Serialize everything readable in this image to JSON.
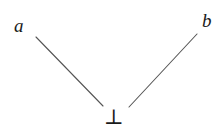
{
  "figure": {
    "kind": "hasse-diagram",
    "width": 224,
    "height": 140,
    "background_color": "#ffffff",
    "line_color": "#555555",
    "text_color": "#1a1a1a",
    "nodes": [
      {
        "id": "a",
        "label": "a",
        "role": "atom-left",
        "x": 22,
        "y": 25,
        "style": "italic"
      },
      {
        "id": "b",
        "label": "b",
        "role": "atom-right",
        "x": 209,
        "y": 22,
        "style": "italic"
      },
      {
        "id": "bottom",
        "label": "⊥",
        "role": "least-element",
        "x": 114,
        "y": 118,
        "style": "upright"
      }
    ],
    "edges": [
      {
        "id": "edge-bottom-a",
        "from": "bottom",
        "to": "a",
        "x1": 36,
        "y1": 37,
        "x2": 103,
        "y2": 106
      },
      {
        "id": "edge-bottom-b",
        "from": "bottom",
        "to": "b",
        "x1": 197,
        "y1": 34,
        "x2": 129,
        "y2": 107
      }
    ]
  }
}
